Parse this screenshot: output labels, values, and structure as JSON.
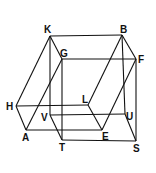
{
  "diagram": {
    "type": "geometric-figure",
    "vertices": {
      "K": {
        "x": 50,
        "y": 36,
        "label": "K",
        "lx": 44,
        "ly": 33
      },
      "B": {
        "x": 122,
        "y": 35,
        "label": "B",
        "lx": 120,
        "ly": 33
      },
      "G": {
        "x": 62,
        "y": 59,
        "label": "G",
        "lx": 60,
        "ly": 57
      },
      "F": {
        "x": 136,
        "y": 59,
        "label": "F",
        "lx": 138,
        "ly": 63
      },
      "H": {
        "x": 16,
        "y": 106,
        "label": "H",
        "lx": 6,
        "ly": 110
      },
      "L": {
        "x": 88,
        "y": 105,
        "label": "L",
        "lx": 82,
        "ly": 103
      },
      "V": {
        "x": 50,
        "y": 115,
        "label": "V",
        "lx": 41,
        "ly": 121
      },
      "U": {
        "x": 125,
        "y": 114,
        "label": "U",
        "lx": 126,
        "ly": 120
      },
      "A": {
        "x": 26,
        "y": 130,
        "label": "A",
        "lx": 22,
        "ly": 141
      },
      "E": {
        "x": 102,
        "y": 130,
        "label": "E",
        "lx": 102,
        "ly": 140
      },
      "T": {
        "x": 62,
        "y": 140,
        "label": "T",
        "lx": 59,
        "ly": 151
      },
      "S": {
        "x": 136,
        "y": 141,
        "label": "S",
        "lx": 133,
        "ly": 152
      }
    },
    "edges": [
      [
        "K",
        "B"
      ],
      [
        "G",
        "F"
      ],
      [
        "K",
        "G"
      ],
      [
        "B",
        "F"
      ],
      [
        "K",
        "H"
      ],
      [
        "H",
        "A"
      ],
      [
        "G",
        "A"
      ],
      [
        "K",
        "V"
      ],
      [
        "V",
        "T"
      ],
      [
        "G",
        "T"
      ],
      [
        "B",
        "L"
      ],
      [
        "L",
        "E"
      ],
      [
        "F",
        "E"
      ],
      [
        "B",
        "U"
      ],
      [
        "U",
        "S"
      ],
      [
        "F",
        "S"
      ],
      [
        "H",
        "L"
      ],
      [
        "V",
        "U"
      ],
      [
        "A",
        "E"
      ],
      [
        "T",
        "S"
      ]
    ],
    "colors": {
      "stroke": "#111111",
      "background": "#ffffff"
    }
  }
}
